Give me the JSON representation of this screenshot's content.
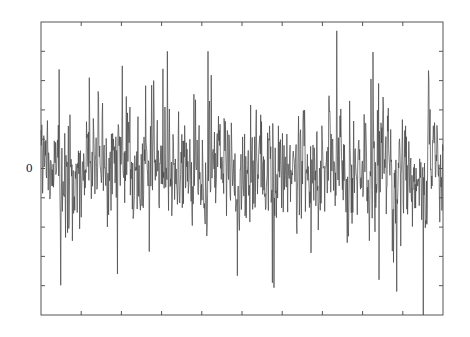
{
  "chart_data": {
    "type": "line",
    "title": "",
    "xlabel": "",
    "ylabel": "",
    "x_tick_labels": [],
    "y_tick_labels": [
      {
        "value": 0,
        "label": "0"
      }
    ],
    "xlim": [
      0,
      1000
    ],
    "ylim": [
      -5,
      5
    ],
    "x_ticks": [
      100,
      200,
      300,
      400,
      500,
      600,
      700,
      800,
      900
    ],
    "y_ticks": [
      -4,
      -3,
      -2,
      -1,
      0,
      1,
      2,
      3,
      4
    ],
    "grid": false,
    "legend": null,
    "series": [
      {
        "name": "signal",
        "description": "dense zero-mean random noise, ~1000 samples, mostly within ±2.5",
        "n_samples": 1000,
        "seed": 7,
        "std": 0.9,
        "spikes": [
          {
            "x": 415,
            "y": 4.0
          },
          {
            "x": 735,
            "y": 4.7
          },
          {
            "x": 190,
            "y": -3.6
          },
          {
            "x": 575,
            "y": -3.9
          },
          {
            "x": 840,
            "y": -3.8
          },
          {
            "x": 950,
            "y": -5.0
          },
          {
            "x": 280,
            "y": 3.0
          },
          {
            "x": 120,
            "y": 3.1
          }
        ],
        "color": "#444444"
      }
    ]
  },
  "plot": {
    "frame_color": "#555555",
    "zero_label": "0"
  }
}
